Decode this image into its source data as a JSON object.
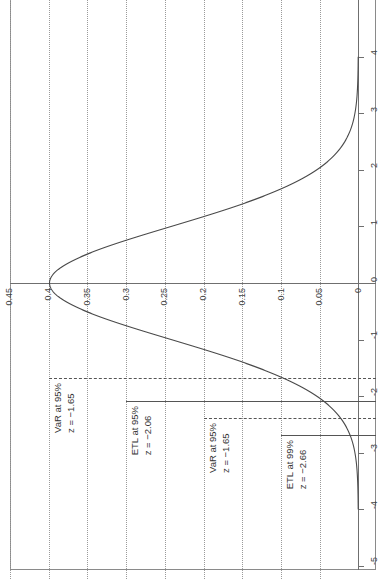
{
  "figure": {
    "name": "normal-density-var-etl",
    "orientation": "rotated-90"
  },
  "axes": {
    "density_axis": {
      "label": "",
      "ticks": [
        "0.45",
        "0.4",
        "0.35",
        "0.3",
        "0.25",
        "0.2",
        "0.15",
        "0.1",
        "0.05",
        "0"
      ],
      "tick_values": [
        0.45,
        0.4,
        0.35,
        0.3,
        0.25,
        0.2,
        0.15,
        0.1,
        0.05,
        0.0
      ]
    },
    "z_axis": {
      "label": "",
      "ticks": [
        "4",
        "3",
        "2",
        "1",
        "0",
        "-1",
        "-2",
        "-3",
        "-4",
        "-5"
      ],
      "tick_values": [
        4,
        3,
        2,
        1,
        0,
        -1,
        -2,
        -3,
        -4,
        -5
      ]
    }
  },
  "annotations": [
    {
      "id": "var-95",
      "title": "VaR at 95%",
      "value": "z = −1.65",
      "z": -1.65,
      "style": "dashed"
    },
    {
      "id": "etl-95",
      "title": "ETL at 95%",
      "value": "z = −2.06",
      "z": -2.06,
      "style": "solid"
    },
    {
      "id": "var-95b",
      "title": "VaR at 95%",
      "value": "z = −1.65",
      "z": -1.65,
      "style": "dashed"
    },
    {
      "id": "etl-99",
      "title": "ETL at 99%",
      "value": "z = −2.66",
      "z": -2.66,
      "style": "solid"
    }
  ],
  "colors": {
    "curve": "#4a4a4a",
    "grid": "#9a9a9a",
    "axis": "#6f6f6f",
    "marker": "#555555",
    "text": "#333333",
    "background": "#ffffff"
  },
  "chart_data": {
    "type": "line",
    "title": "",
    "xlabel": "",
    "ylabel": "",
    "orientation": "horizontal-density",
    "grid": true,
    "legend": "none",
    "xlim": [
      0.45,
      0.0
    ],
    "ylim": [
      4,
      -5
    ],
    "series": [
      {
        "name": "standard normal pdf",
        "x_is": "z",
        "y_is": "density",
        "z": [
          4.0,
          3.8,
          3.6,
          3.4,
          3.2,
          3.0,
          2.8,
          2.6,
          2.4,
          2.2,
          2.0,
          1.8,
          1.6,
          1.4,
          1.2,
          1.0,
          0.8,
          0.6,
          0.4,
          0.2,
          0.0,
          -0.2,
          -0.4,
          -0.6,
          -0.8,
          -1.0,
          -1.2,
          -1.4,
          -1.6,
          -1.8,
          -2.0,
          -2.2,
          -2.4,
          -2.6,
          -2.8,
          -3.0,
          -3.2,
          -3.4,
          -3.6,
          -3.8,
          -4.0
        ],
        "density": [
          0.0001,
          0.0003,
          0.0006,
          0.0012,
          0.0024,
          0.0044,
          0.0079,
          0.0136,
          0.0224,
          0.0355,
          0.054,
          0.079,
          0.1109,
          0.1497,
          0.1942,
          0.242,
          0.2897,
          0.3332,
          0.3683,
          0.391,
          0.3989,
          0.391,
          0.3683,
          0.3332,
          0.2897,
          0.242,
          0.1942,
          0.1497,
          0.1109,
          0.079,
          0.054,
          0.0355,
          0.0224,
          0.0136,
          0.0079,
          0.0044,
          0.0024,
          0.0012,
          0.0006,
          0.0003,
          0.0001
        ]
      }
    ],
    "markers": [
      {
        "label": "VaR at 95%",
        "z": -1.65,
        "style": "dashed"
      },
      {
        "label": "ETL at 95%",
        "z": -2.06,
        "style": "solid"
      },
      {
        "label": "VaR at 95%",
        "z": -1.65,
        "style": "dashed"
      },
      {
        "label": "ETL at 99%",
        "z": -2.66,
        "style": "solid"
      }
    ]
  }
}
